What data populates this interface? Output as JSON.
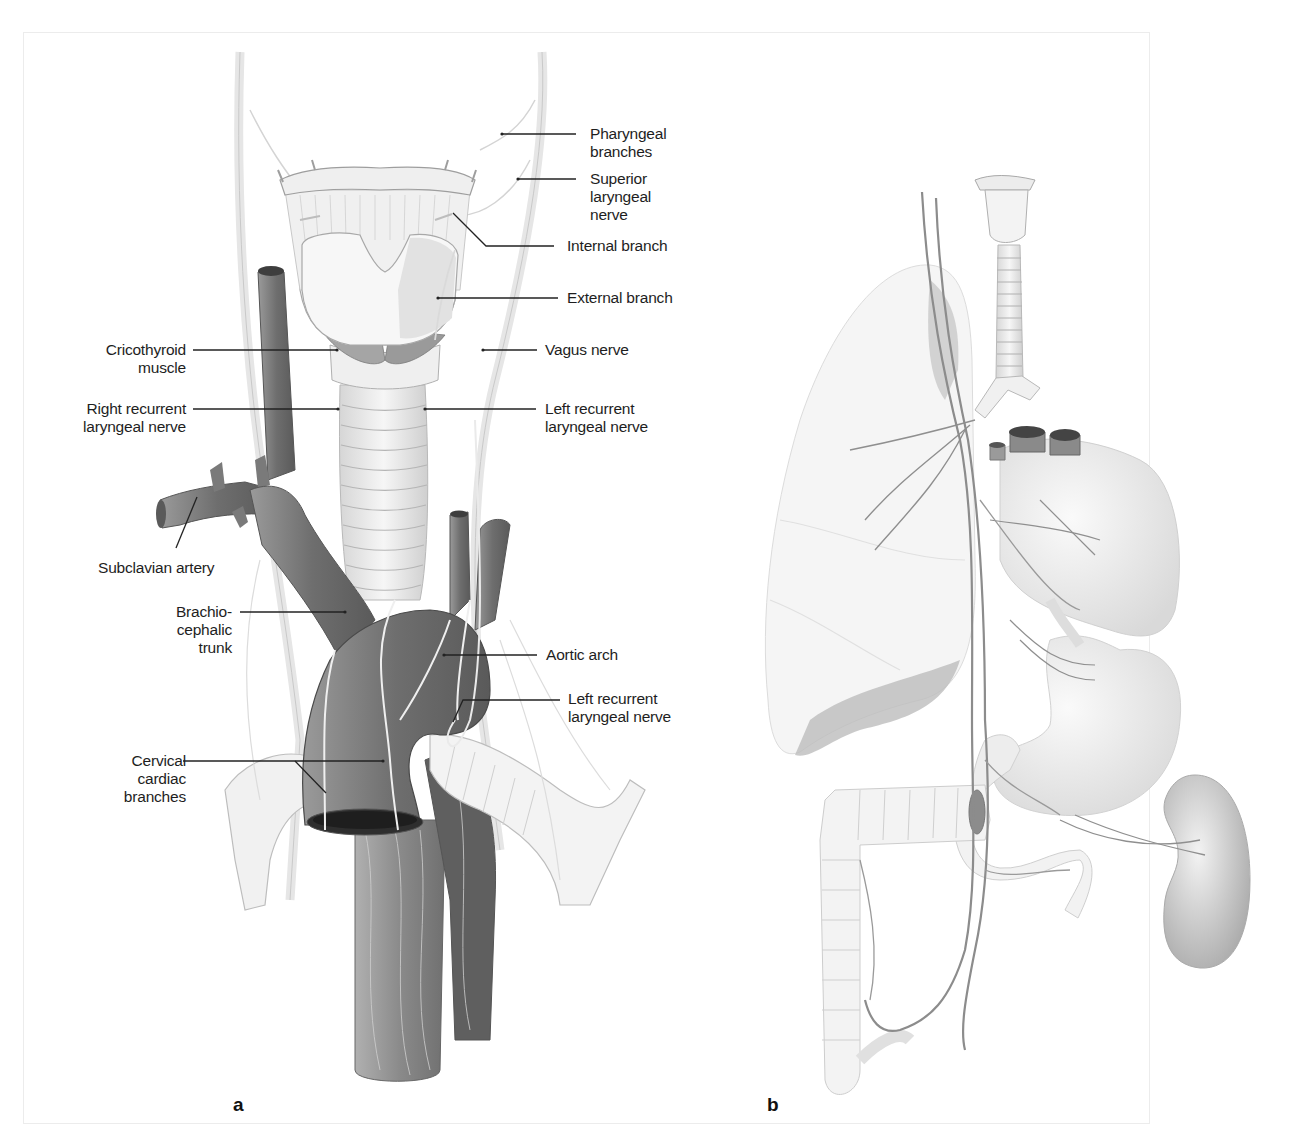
{
  "figure": {
    "panels": [
      {
        "id": "a",
        "letter": "a"
      },
      {
        "id": "b",
        "letter": "b"
      }
    ]
  },
  "labels_a": {
    "pharyngeal": {
      "line1": "Pharyngeal",
      "line2": "branches"
    },
    "superior_laryngeal": {
      "line1": "Superior",
      "line2": "laryngeal",
      "line3": "nerve"
    },
    "internal_branch": "Internal branch",
    "external_branch": "External branch",
    "vagus": "Vagus nerve",
    "left_recurrent_upper": {
      "line1": "Left recurrent",
      "line2": "laryngeal nerve"
    },
    "cricothyroid": {
      "line1": "Cricothyroid",
      "line2": "muscle"
    },
    "right_recurrent": {
      "line1": "Right recurrent",
      "line2": "laryngeal nerve"
    },
    "subclavian": "Subclavian artery",
    "brachiocephalic": {
      "line1": "Brachio-",
      "line2": "cephalic",
      "line3": "trunk"
    },
    "aortic_arch": "Aortic arch",
    "left_recurrent_lower": {
      "line1": "Left recurrent",
      "line2": "laryngeal nerve"
    },
    "cervical_cardiac": {
      "line1": "Cervical",
      "line2": "cardiac",
      "line3": "branches"
    }
  },
  "colors": {
    "vessel_dark": "#6f6f6f",
    "vessel_mid": "#8a8a8a",
    "cartilage": "#ececec",
    "nerve_light": "#f2f2f2",
    "nerve_dark": "#8c8c8c",
    "organ_fill": "#efefef",
    "leader_line": "#222222"
  }
}
